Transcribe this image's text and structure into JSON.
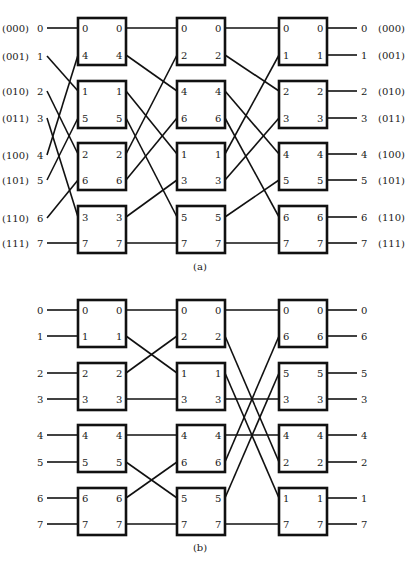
{
  "figure": {
    "panels": [
      {
        "id": "a",
        "caption": "(a)",
        "box_rows": [
          {
            "top": 18,
            "rows": [
              28,
              55
            ]
          },
          {
            "top": 81,
            "rows": [
              91,
              118
            ]
          },
          {
            "top": 143,
            "rows": [
              154,
              180
            ]
          },
          {
            "top": 206,
            "rows": [
              217,
              243
            ]
          }
        ],
        "inputs": [
          {
            "label": "0",
            "binary": "(000)",
            "y": 28,
            "to_stage": 0,
            "to_box": 0,
            "to_port": 0
          },
          {
            "label": "1",
            "binary": "(001)",
            "y": 56,
            "to_stage": 0,
            "to_box": 1,
            "to_port": 0
          },
          {
            "label": "2",
            "binary": "(010)",
            "y": 91,
            "to_stage": 0,
            "to_box": 2,
            "to_port": 0
          },
          {
            "label": "3",
            "binary": "(011)",
            "y": 118,
            "to_stage": 0,
            "to_box": 3,
            "to_port": 0
          },
          {
            "label": "4",
            "binary": "(100)",
            "y": 155,
            "to_stage": 0,
            "to_box": 0,
            "to_port": 1
          },
          {
            "label": "5",
            "binary": "(101)",
            "y": 180,
            "to_stage": 0,
            "to_box": 1,
            "to_port": 1
          },
          {
            "label": "6",
            "binary": "(110)",
            "y": 218,
            "to_stage": 0,
            "to_box": 2,
            "to_port": 1
          },
          {
            "label": "7",
            "binary": "(111)",
            "y": 243,
            "to_stage": 0,
            "to_box": 3,
            "to_port": 1
          }
        ],
        "stages": [
          {
            "boxes": [
              [
                "0",
                "4"
              ],
              [
                "1",
                "5"
              ],
              [
                "2",
                "6"
              ],
              [
                "3",
                "7"
              ]
            ]
          },
          {
            "boxes": [
              [
                "0",
                "2"
              ],
              [
                "4",
                "6"
              ],
              [
                "1",
                "3"
              ],
              [
                "5",
                "7"
              ]
            ]
          },
          {
            "boxes": [
              [
                "0",
                "1"
              ],
              [
                "2",
                "3"
              ],
              [
                "4",
                "5"
              ],
              [
                "6",
                "7"
              ]
            ]
          }
        ],
        "outputs": [
          {
            "label": "0",
            "binary": "(000)"
          },
          {
            "label": "1",
            "binary": "(001)"
          },
          {
            "label": "2",
            "binary": "(010)"
          },
          {
            "label": "3",
            "binary": "(011)"
          },
          {
            "label": "4",
            "binary": "(100)"
          },
          {
            "label": "5",
            "binary": "(101)"
          },
          {
            "label": "6",
            "binary": "(110)"
          },
          {
            "label": "7",
            "binary": "(111)"
          }
        ]
      },
      {
        "id": "b",
        "caption": "(b)",
        "box_rows": [
          {
            "top": 300,
            "rows": [
              310,
              336
            ]
          },
          {
            "top": 363,
            "rows": [
              373,
              399
            ]
          },
          {
            "top": 425,
            "rows": [
              435,
              462
            ]
          },
          {
            "top": 488,
            "rows": [
              498,
              524
            ]
          }
        ],
        "inputs": [
          {
            "label": "0"
          },
          {
            "label": "1"
          },
          {
            "label": "2"
          },
          {
            "label": "3"
          },
          {
            "label": "4"
          },
          {
            "label": "5"
          },
          {
            "label": "6"
          },
          {
            "label": "7"
          }
        ],
        "stages": [
          {
            "boxes": [
              [
                "0",
                "1"
              ],
              [
                "2",
                "3"
              ],
              [
                "4",
                "5"
              ],
              [
                "6",
                "7"
              ]
            ]
          },
          {
            "boxes": [
              [
                "0",
                "2"
              ],
              [
                "1",
                "3"
              ],
              [
                "4",
                "6"
              ],
              [
                "5",
                "7"
              ]
            ]
          },
          {
            "boxes": [
              [
                "0",
                "6"
              ],
              [
                "5",
                "3"
              ],
              [
                "4",
                "2"
              ],
              [
                "1",
                "7"
              ]
            ]
          }
        ],
        "outputs": [
          {
            "label": "0"
          },
          {
            "label": "6"
          },
          {
            "label": "5"
          },
          {
            "label": "3"
          },
          {
            "label": "4"
          },
          {
            "label": "2"
          },
          {
            "label": "1"
          },
          {
            "label": "7"
          }
        ]
      }
    ],
    "footer_caption": ""
  }
}
